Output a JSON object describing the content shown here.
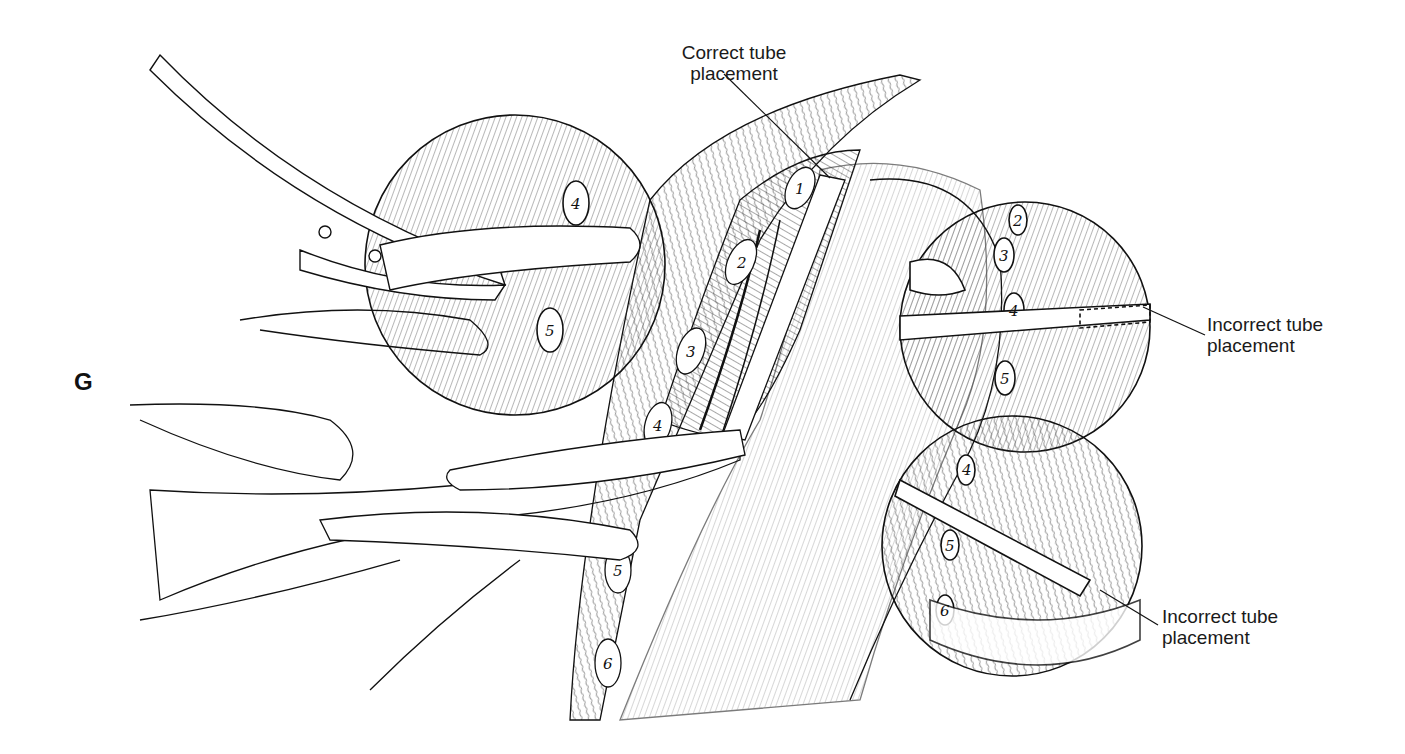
{
  "figure": {
    "panel_letter": "G",
    "labels": {
      "correct": "Correct tube placement",
      "correct_line1": "Correct tube",
      "correct_line2": "placement",
      "incorrect_upper_line1": "Incorrect tube",
      "incorrect_upper_line2": "placement",
      "incorrect_lower_line1": "Incorrect tube",
      "incorrect_lower_line2": "placement"
    },
    "rib_numbers": {
      "main": [
        "1",
        "2",
        "3",
        "4",
        "5",
        "6"
      ],
      "inset_left": [
        "4",
        "5"
      ],
      "inset_upper_right": [
        "2",
        "3",
        "4",
        "5"
      ],
      "inset_lower_right": [
        "4",
        "5",
        "6"
      ]
    },
    "colors": {
      "ink": "#111111",
      "background": "#ffffff"
    }
  }
}
